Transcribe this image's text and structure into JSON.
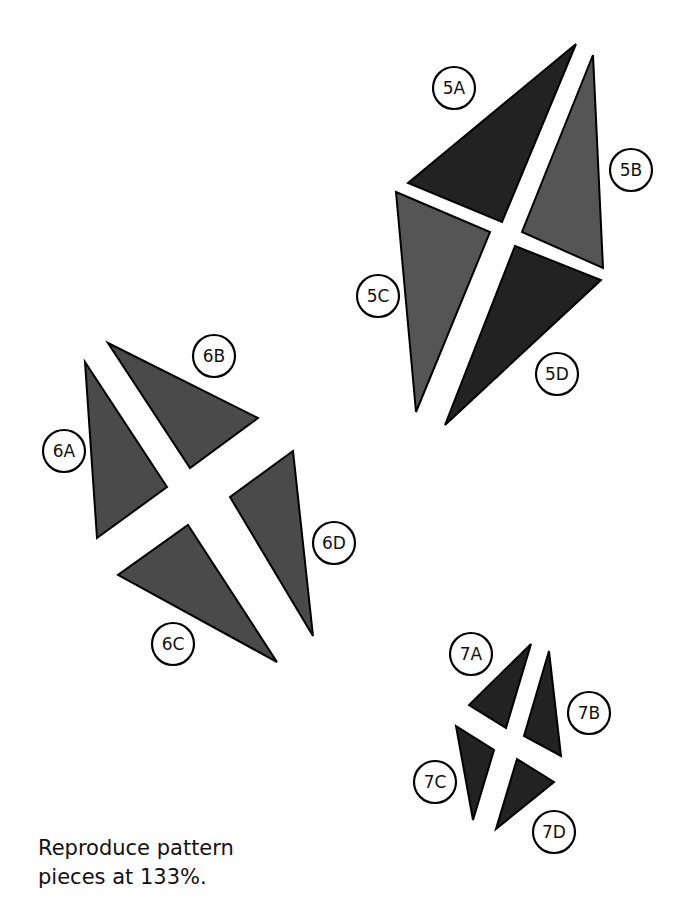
{
  "note": {
    "line1": "Reproduce pattern",
    "line2": "pieces at 133%."
  },
  "colors": {
    "dark": "#222222",
    "medium": "#555555",
    "group6": "#4a4a4a",
    "stroke": "#000000"
  },
  "groups": [
    {
      "id": "5",
      "pieces": [
        {
          "label": "5A",
          "shade": "dark",
          "points": "576,44 408,183 502,222",
          "label_pos": [
            454,
            88
          ]
        },
        {
          "label": "5B",
          "shade": "medium",
          "points": "593,55 522,232 603,268",
          "label_pos": [
            631,
            170
          ]
        },
        {
          "label": "5C",
          "shade": "medium",
          "points": "396,192 490,232 416,412",
          "label_pos": [
            378,
            296
          ]
        },
        {
          "label": "5D",
          "shade": "dark",
          "points": "515,246 601,280 445,425",
          "label_pos": [
            557,
            374
          ]
        }
      ]
    },
    {
      "id": "6",
      "pieces": [
        {
          "label": "6A",
          "shade": "group6",
          "points": "85,362 167,487 97,538",
          "label_pos": [
            64,
            451
          ]
        },
        {
          "label": "6B",
          "shade": "group6",
          "points": "108,343 258,418 190,468",
          "label_pos": [
            214,
            356
          ]
        },
        {
          "label": "6C",
          "shade": "group6",
          "points": "188,525 277,662 118,575",
          "label_pos": [
            173,
            644
          ]
        },
        {
          "label": "6D",
          "shade": "group6",
          "points": "293,451 313,636 230,497",
          "label_pos": [
            334,
            543
          ]
        }
      ]
    },
    {
      "id": "7",
      "pieces": [
        {
          "label": "7A",
          "shade": "dark",
          "points": "531,644 469,705 506,728",
          "label_pos": [
            471,
            654
          ]
        },
        {
          "label": "7B",
          "shade": "dark",
          "points": "549,651 561,756 524,736",
          "label_pos": [
            589,
            713
          ]
        },
        {
          "label": "7C",
          "shade": "dark",
          "points": "456,726 494,750 473,820",
          "label_pos": [
            435,
            782
          ]
        },
        {
          "label": "7D",
          "shade": "dark",
          "points": "517,759 554,782 496,829",
          "label_pos": [
            554,
            832
          ]
        }
      ]
    }
  ]
}
